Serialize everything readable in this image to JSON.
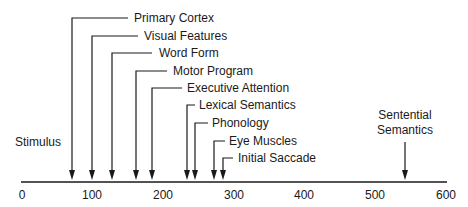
{
  "diagram": {
    "type": "timeline",
    "axis": {
      "min": 0,
      "max": 600,
      "ticks": [
        "0",
        "100",
        "200",
        "300",
        "400",
        "500",
        "600"
      ],
      "color": "#1a1a1a"
    },
    "start_label": "Stimulus",
    "events": [
      {
        "label": "Primary Cortex",
        "time_ms": 72
      },
      {
        "label": "Visual Features",
        "time_ms": 100
      },
      {
        "label": "Word Form",
        "time_ms": 128
      },
      {
        "label": "Motor Program",
        "time_ms": 162
      },
      {
        "label": "Executive Attention",
        "time_ms": 184
      },
      {
        "label": "Lexical Semantics",
        "time_ms": 234
      },
      {
        "label": "Phonology",
        "time_ms": 245
      },
      {
        "label": "Eye Muscles",
        "time_ms": 272
      },
      {
        "label": "Initial Saccade",
        "time_ms": 284
      },
      {
        "label": "Sentential Semantics",
        "line1": "Sentential",
        "line2": "Semantics",
        "time_ms": 550
      }
    ]
  }
}
